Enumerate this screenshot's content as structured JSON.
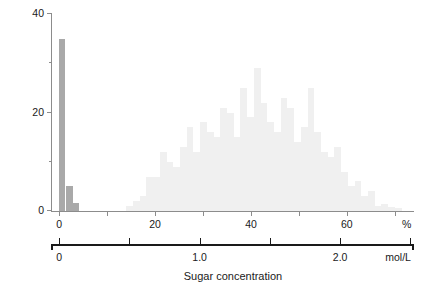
{
  "chart_data": {
    "type": "bar",
    "title": "",
    "xlabel": "Sugar concentration",
    "ylabel": "Number of loads",
    "ylim": [
      0,
      40
    ],
    "xlim_percent": [
      -1.5,
      74
    ],
    "grid": false,
    "legend": "none",
    "y_ticks": [
      {
        "value": 0,
        "label": "0",
        "minor": false
      },
      {
        "value": 10,
        "label": "",
        "minor": true
      },
      {
        "value": 20,
        "label": "20",
        "minor": false
      },
      {
        "value": 30,
        "label": "",
        "minor": true
      },
      {
        "value": 40,
        "label": "40",
        "minor": false
      }
    ],
    "x_axis_percent": {
      "unit": "%",
      "ticks": [
        {
          "value": 0,
          "label": "0"
        },
        {
          "value": 10,
          "label": ""
        },
        {
          "value": 20,
          "label": "20"
        },
        {
          "value": 30,
          "label": ""
        },
        {
          "value": 40,
          "label": "40"
        },
        {
          "value": 50,
          "label": ""
        },
        {
          "value": 60,
          "label": "60"
        },
        {
          "value": 70,
          "label": ""
        }
      ]
    },
    "x_axis_molar": {
      "unit": "mol/L",
      "percent_per_mol": 29.3,
      "ticks": [
        {
          "value": 0.0,
          "label": "0"
        },
        {
          "value": 0.5,
          "label": ""
        },
        {
          "value": 1.0,
          "label": "1.0"
        },
        {
          "value": 1.5,
          "label": ""
        },
        {
          "value": 2.0,
          "label": "2.0"
        },
        {
          "value": 2.5,
          "label": ""
        }
      ]
    },
    "series": [
      {
        "name": "empty loads",
        "color": "#a9a9a9",
        "bin_width_percent": 1.4,
        "bars": [
          {
            "x": -0.1,
            "value": 35
          },
          {
            "x": 1.4,
            "value": 5
          },
          {
            "x": 2.8,
            "value": 1.6
          }
        ]
      },
      {
        "name": "nectar loads",
        "color": "#f0f0f0",
        "bin_width_percent": 1.4,
        "bars": [
          {
            "x": 14.0,
            "value": 1
          },
          {
            "x": 15.4,
            "value": 2
          },
          {
            "x": 16.8,
            "value": 3
          },
          {
            "x": 18.2,
            "value": 7
          },
          {
            "x": 19.6,
            "value": 7
          },
          {
            "x": 21.0,
            "value": 12
          },
          {
            "x": 22.4,
            "value": 10
          },
          {
            "x": 23.8,
            "value": 9
          },
          {
            "x": 25.2,
            "value": 13
          },
          {
            "x": 26.6,
            "value": 17
          },
          {
            "x": 28.0,
            "value": 12
          },
          {
            "x": 29.4,
            "value": 18
          },
          {
            "x": 30.8,
            "value": 16
          },
          {
            "x": 32.2,
            "value": 15
          },
          {
            "x": 33.6,
            "value": 21
          },
          {
            "x": 35.0,
            "value": 20
          },
          {
            "x": 36.4,
            "value": 15
          },
          {
            "x": 37.8,
            "value": 25
          },
          {
            "x": 39.2,
            "value": 19
          },
          {
            "x": 40.6,
            "value": 29
          },
          {
            "x": 42.0,
            "value": 22
          },
          {
            "x": 43.4,
            "value": 18
          },
          {
            "x": 44.8,
            "value": 16
          },
          {
            "x": 46.2,
            "value": 23
          },
          {
            "x": 47.6,
            "value": 21
          },
          {
            "x": 49.0,
            "value": 14
          },
          {
            "x": 50.4,
            "value": 17
          },
          {
            "x": 51.8,
            "value": 25
          },
          {
            "x": 53.2,
            "value": 16
          },
          {
            "x": 54.6,
            "value": 12
          },
          {
            "x": 56.0,
            "value": 11
          },
          {
            "x": 57.4,
            "value": 13
          },
          {
            "x": 58.8,
            "value": 8
          },
          {
            "x": 60.2,
            "value": 5
          },
          {
            "x": 61.6,
            "value": 6
          },
          {
            "x": 63.0,
            "value": 3
          },
          {
            "x": 64.4,
            "value": 4
          },
          {
            "x": 65.8,
            "value": 1
          },
          {
            "x": 67.2,
            "value": 1.5
          },
          {
            "x": 68.6,
            "value": 0.8
          },
          {
            "x": 70.0,
            "value": 0.6
          }
        ]
      }
    ]
  },
  "caption": {
    "text": ""
  }
}
